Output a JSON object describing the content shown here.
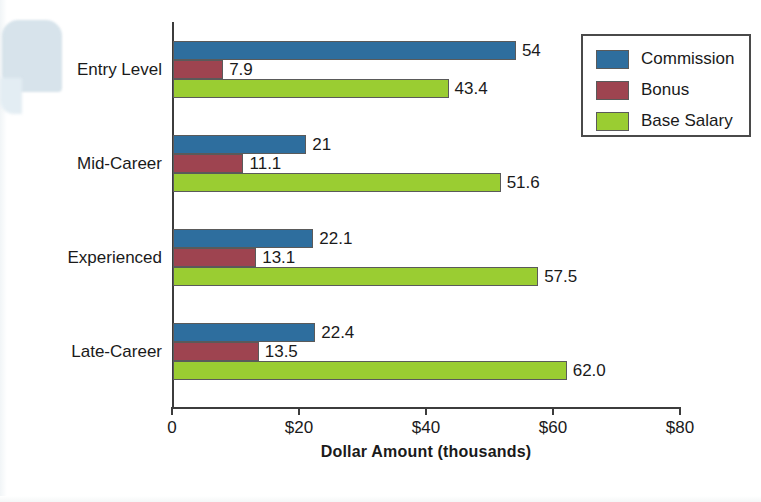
{
  "chart_data": {
    "type": "bar",
    "orientation": "horizontal",
    "title": "",
    "xlabel": "Dollar Amount (thousands)",
    "ylabel": "Experience Level",
    "categories": [
      "Entry Level",
      "Mid-Career",
      "Experienced",
      "Late-Career"
    ],
    "series": [
      {
        "name": "Commission",
        "color": "#2E6E9E",
        "values": [
          54,
          21,
          22.1,
          22.4
        ],
        "labels": [
          "54",
          "21",
          "22.1",
          "22.4"
        ]
      },
      {
        "name": "Bonus",
        "color": "#9E4450",
        "values": [
          7.9,
          11.1,
          13.1,
          13.5
        ],
        "labels": [
          "7.9",
          "11.1",
          "13.1",
          "13.5"
        ]
      },
      {
        "name": "Base Salary",
        "color": "#9ACD32",
        "values": [
          43.4,
          51.6,
          57.5,
          62.0
        ],
        "labels": [
          "43.4",
          "51.6",
          "57.5",
          "62.0"
        ]
      }
    ],
    "xticks": [
      0,
      20,
      40,
      60,
      80
    ],
    "xtick_labels": [
      "0",
      "$20",
      "$40",
      "$60",
      "$80"
    ],
    "xlim": [
      0,
      80
    ],
    "grid": false,
    "legend_position": "top-right",
    "legend_entries": [
      "Commission",
      "Bonus",
      "Base Salary"
    ]
  },
  "axis": {
    "xlabel": "Dollar Amount (thousands)",
    "ylabel": "Experience Level"
  },
  "legend": {
    "items": [
      {
        "label": "Commission",
        "color": "#2E6E9E"
      },
      {
        "label": "Bonus",
        "color": "#9E4450"
      },
      {
        "label": "Base Salary",
        "color": "#9ACD32"
      }
    ]
  }
}
